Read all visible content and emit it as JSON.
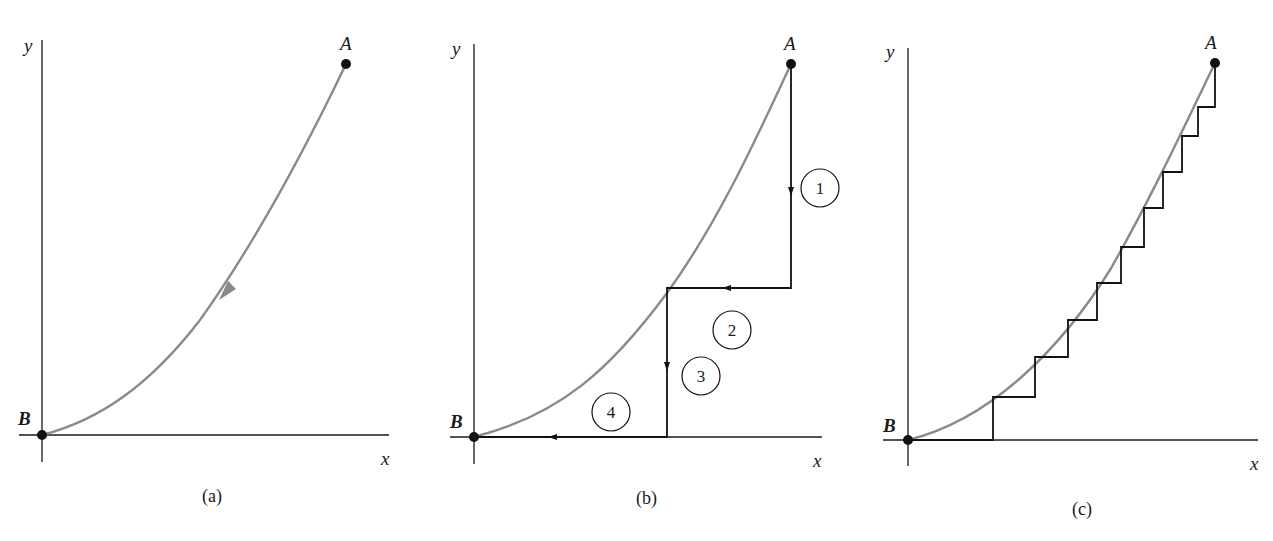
{
  "colors": {
    "curve": "#8a8a8a",
    "ink": "#1a1a1a",
    "background": "#ffffff"
  },
  "panels": [
    {
      "id": "a",
      "caption": "(a)",
      "axis_x_label": "x",
      "axis_y_label": "y",
      "point_start": "A",
      "point_end": "B",
      "description": "Curved path from A to B with arrow indicating direction along the curve"
    },
    {
      "id": "b",
      "caption": "(b)",
      "axis_x_label": "x",
      "axis_y_label": "y",
      "point_start": "A",
      "point_end": "B",
      "segments": [
        {
          "label": "1",
          "direction": "down (vertical)"
        },
        {
          "label": "2",
          "direction": "left (horizontal)"
        },
        {
          "label": "3",
          "direction": "down (vertical)"
        },
        {
          "label": "4",
          "direction": "left (horizontal)"
        }
      ],
      "description": "Curve A to B approximated by a two-step staircase path of segments 1-4"
    },
    {
      "id": "c",
      "caption": "(c)",
      "axis_x_label": "x",
      "axis_y_label": "y",
      "point_start": "A",
      "point_end": "B",
      "step_count": 10,
      "description": "Curve A to B approximated by many small vertical/horizontal steps"
    }
  ]
}
